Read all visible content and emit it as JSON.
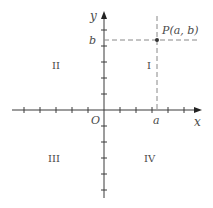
{
  "diagram": {
    "colors": {
      "axis": "#3a3a3a",
      "dash": "#888888",
      "text": "#4a4a4a",
      "point": "#333333"
    },
    "axes": {
      "x_label": "x",
      "y_label": "y",
      "origin_label": "O"
    },
    "quadrants": {
      "q1": "I",
      "q2": "II",
      "q3": "III",
      "q4": "IV"
    },
    "point": {
      "label": "P(a, b)",
      "x_label": "a",
      "y_label": "b"
    }
  }
}
